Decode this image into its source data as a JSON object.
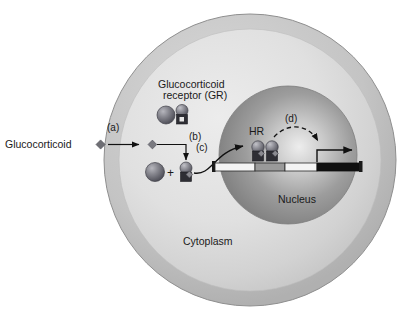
{
  "figure": {
    "background_color": "#ffffff"
  },
  "cell": {
    "label": "Cytoplasm",
    "membrane_color": "#b8b8b8",
    "cytoplasm_color": "#dcdcdc"
  },
  "nucleus": {
    "label": "Nucleus",
    "fill_color": "#8f8f8f",
    "highlight_color": "#e8e8e8"
  },
  "ligand": {
    "label": "Glucocorticoid",
    "marker_color": "#6e6e74",
    "shape": "diamond"
  },
  "receptor": {
    "label_line1": "Glucocorticoid",
    "label_line2": "receptor (GR)",
    "hsp_color": "#808088",
    "body_color": "#6a6a72"
  },
  "dimer": {
    "label": "HR"
  },
  "dna": {
    "strand_color": "#f4f4f4",
    "hre_color": "#9a9a9a",
    "gene_color": "#101010",
    "outline_color": "#2a2a2a"
  },
  "steps": [
    {
      "id": "a",
      "label": "(a)",
      "description": "ligand enters cell"
    },
    {
      "id": "b",
      "label": "(b)",
      "description": "ligand binds receptor complex"
    },
    {
      "id": "c",
      "label": "(c)",
      "description": "activated receptor translocates to nucleus"
    },
    {
      "id": "d",
      "label": "(d)",
      "description": "transcription activation"
    }
  ]
}
